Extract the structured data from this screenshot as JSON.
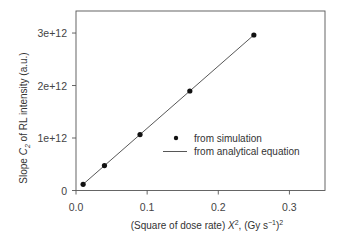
{
  "chart_data": {
    "type": "scatter",
    "title": "",
    "xlabel": "(Square of dose rate) X², (Gy s⁻¹)²",
    "ylabel": "Slope C₂ of RL intensity (a.u.)",
    "xlabel_parts": {
      "pre": "(Square of dose rate) ",
      "var": "X",
      "sup": "2",
      "mid": ", (Gy s",
      "unit_sup": "−1",
      "post": ")",
      "post_sup": "2"
    },
    "ylabel_parts": {
      "pre": "Slope ",
      "var": "C",
      "sub": "2",
      "post": " of RL intensity (a.u.)"
    },
    "xlim": [
      0,
      0.35
    ],
    "ylim": [
      0,
      3420000000000.0
    ],
    "xticks": [
      0.0,
      0.1,
      0.2,
      0.3
    ],
    "xtick_labels": [
      "0.0",
      "0.1",
      "0.2",
      "0.3"
    ],
    "yticks": [
      0,
      1000000000000.0,
      2000000000000.0,
      3000000000000.0
    ],
    "ytick_labels": [
      "0",
      "1e+12",
      "2e+12",
      "3e+12"
    ],
    "grid": false,
    "legend_position": "inside right-center",
    "series": [
      {
        "name": "from simulation",
        "kind": "scatter",
        "marker": "filled-circle",
        "x": [
          0.01,
          0.04,
          0.09,
          0.16,
          0.25
        ],
        "y": [
          118000000000.0,
          474000000000.0,
          1066000000000.0,
          1896000000000.0,
          2963000000000.0
        ]
      },
      {
        "name": "from analytical equation",
        "kind": "line",
        "x": [
          0.01,
          0.04,
          0.09,
          0.16,
          0.25
        ],
        "y": [
          118500000000.0,
          474000000000.0,
          1066500000000.0,
          1896000000000.0,
          2962500000000.0
        ]
      }
    ]
  },
  "legend": {
    "items": [
      {
        "label": "from simulation",
        "symbol": "dot"
      },
      {
        "label": "from analytical equation",
        "symbol": "line"
      }
    ]
  },
  "colors": {
    "axis": "#555555",
    "marker": "#111111",
    "line": "#444444",
    "text": "#333333"
  }
}
